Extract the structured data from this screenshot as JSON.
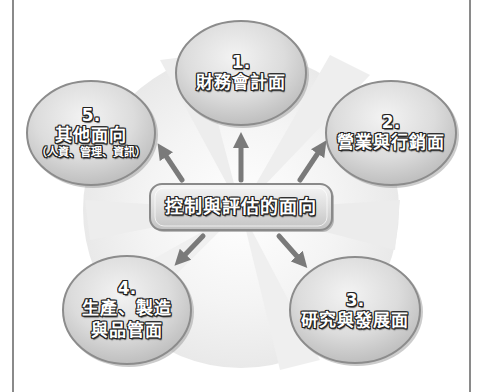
{
  "diagram": {
    "center": {
      "label": "控制與評估的面向"
    },
    "nodes": [
      {
        "number": "1.",
        "label": "財務會計面",
        "sub": ""
      },
      {
        "number": "2.",
        "label": "營業與行銷面",
        "sub": ""
      },
      {
        "number": "3.",
        "label": "研究與發展面",
        "sub": ""
      },
      {
        "number": "4.",
        "label_line1": "生產、製造",
        "label_line2": "與品管面"
      },
      {
        "number": "5.",
        "label": "其他面向",
        "sub": "（人資、管理、資訊）"
      }
    ],
    "colors": {
      "ellipse_fill": "#d9d9d9",
      "ellipse_border": "#8c8c8c",
      "arrow": "#7a7a7a",
      "text": "#ffffff",
      "text_outline": "#222222",
      "frame": "#8a8a8a"
    }
  }
}
